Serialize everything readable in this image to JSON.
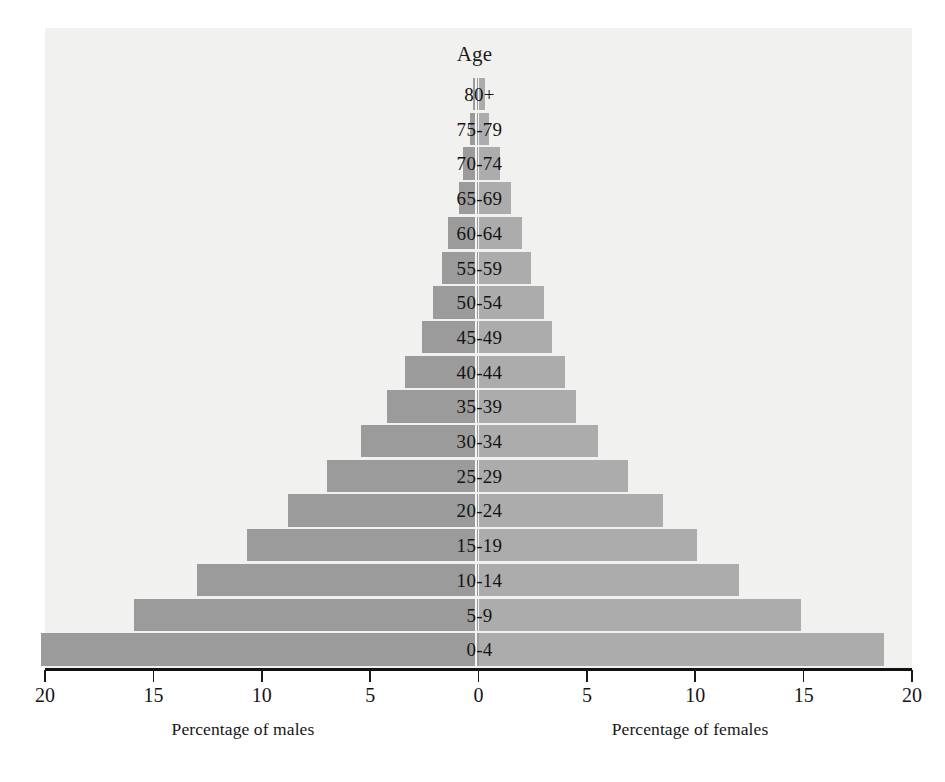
{
  "chart_data": {
    "type": "bar",
    "subtype": "population-pyramid",
    "title": "Age",
    "categories": [
      "80+",
      "75-79",
      "70-74",
      "65-69",
      "60-64",
      "55-59",
      "50-54",
      "45-49",
      "40-44",
      "35-39",
      "30-34",
      "25-29",
      "20-24",
      "15-19",
      "10-14",
      "5-9",
      "0-4"
    ],
    "series": [
      {
        "name": "Percentage of males",
        "side": "left",
        "color": "#9b9b9b",
        "values": [
          0.25,
          0.4,
          0.7,
          0.9,
          1.4,
          1.7,
          2.1,
          2.6,
          3.4,
          4.2,
          5.4,
          7.0,
          8.8,
          10.7,
          13.0,
          15.9,
          20.2
        ]
      },
      {
        "name": "Percentage of females",
        "side": "right",
        "color": "#acacac",
        "values": [
          0.3,
          0.5,
          1.0,
          1.5,
          2.0,
          2.4,
          3.0,
          3.4,
          4.0,
          4.5,
          5.5,
          6.9,
          8.5,
          10.1,
          12.0,
          14.9,
          18.7
        ]
      }
    ],
    "xlabel_left": "Percentage of males",
    "xlabel_right": "Percentage of females",
    "ylabel": "Age",
    "xlim": [
      -20,
      20
    ],
    "axis_max": 20,
    "tick_step": 5,
    "tick_labels_left": [
      "20",
      "15",
      "10",
      "5"
    ],
    "tick_labels_center": "0",
    "tick_labels_right": [
      "5",
      "10",
      "15",
      "20"
    ],
    "all_tick_labels": [
      "20",
      "15",
      "10",
      "5",
      "0",
      "5",
      "10",
      "15",
      "20"
    ],
    "grid": false,
    "legend": "none",
    "plot_background": "#f1f1ef",
    "axis_color": "#111111",
    "separator_color": "#f3f3f1"
  },
  "axis": {
    "caption_left": "Percentage of males",
    "caption_right": "Percentage of females"
  }
}
